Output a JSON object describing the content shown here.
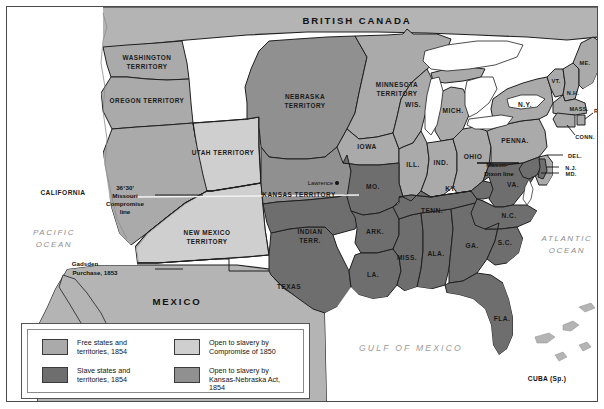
{
  "map": {
    "title_country_north": "BRITISH CANADA",
    "title_country_south": "MEXICO",
    "oceans": [
      {
        "name": "PACIFIC OCEAN",
        "line1": "PACIFIC",
        "line2": "OCEAN"
      },
      {
        "name": "ATLANTIC OCEAN",
        "line1": "ATLANTIC",
        "line2": "OCEAN"
      }
    ],
    "gulf_label": "GULF OF MEXICO",
    "cuba_label": "CUBA (Sp.)",
    "city": {
      "name": "Lawrence"
    },
    "annotations": [
      {
        "id": "missouri-compromise",
        "line1": "36°30'",
        "line2": "Missouri",
        "line3": "Compromise",
        "line4": "line"
      },
      {
        "id": "gadsden",
        "line1": "Gadsden",
        "line2": "Purchase, 1853"
      },
      {
        "id": "mason-dixon",
        "line1": "Mason-",
        "line2": "Dixon line"
      }
    ],
    "territories": [
      {
        "id": "washington",
        "line1": "WASHINGTON",
        "line2": "TERRITORY"
      },
      {
        "id": "oregon",
        "line1": "OREGON TERRITORY",
        "line2": ""
      },
      {
        "id": "utah",
        "line1": "UTAH TERRITORY",
        "line2": ""
      },
      {
        "id": "new-mexico",
        "line1": "NEW MEXICO",
        "line2": "TERRITORY"
      },
      {
        "id": "nebraska",
        "line1": "NEBRASKA",
        "line2": "TERRITORY"
      },
      {
        "id": "kansas",
        "line1": "KANSAS TERRITORY",
        "line2": ""
      },
      {
        "id": "minnesota",
        "line1": "MINNESOTA",
        "line2": "TERRITORY"
      },
      {
        "id": "indian",
        "line1": "INDIAN",
        "line2": "TERR."
      }
    ],
    "states": [
      {
        "id": "california",
        "label": "CALIFORNIA"
      },
      {
        "id": "texas",
        "label": "TEXAS"
      },
      {
        "id": "iowa",
        "label": "IOWA"
      },
      {
        "id": "wisconsin",
        "label": "WIS."
      },
      {
        "id": "michigan",
        "label": "MICH."
      },
      {
        "id": "illinois",
        "label": "ILL."
      },
      {
        "id": "indiana",
        "label": "IND."
      },
      {
        "id": "ohio",
        "label": "OHIO"
      },
      {
        "id": "missouri",
        "label": "MO."
      },
      {
        "id": "arkansas",
        "label": "ARK."
      },
      {
        "id": "louisiana",
        "label": "LA."
      },
      {
        "id": "mississippi",
        "label": "MISS."
      },
      {
        "id": "alabama",
        "label": "ALA."
      },
      {
        "id": "georgia",
        "label": "GA."
      },
      {
        "id": "florida",
        "label": "FLA."
      },
      {
        "id": "tennessee",
        "label": "TENN."
      },
      {
        "id": "kentucky",
        "label": "KY."
      },
      {
        "id": "virginia",
        "label": "VA."
      },
      {
        "id": "north-carolina",
        "label": "N.C."
      },
      {
        "id": "south-carolina",
        "label": "S.C."
      },
      {
        "id": "pennsylvania",
        "label": "PENNA."
      },
      {
        "id": "new-york",
        "label": "N.Y."
      },
      {
        "id": "maine",
        "label": "ME."
      },
      {
        "id": "vermont",
        "label": "VT."
      },
      {
        "id": "new-hampshire",
        "label": "N.H."
      },
      {
        "id": "massachusetts",
        "label": "MASS."
      },
      {
        "id": "rhode-island",
        "label": "R.I."
      },
      {
        "id": "connecticut",
        "label": "CONN."
      },
      {
        "id": "new-jersey",
        "label": "N.J."
      },
      {
        "id": "delaware",
        "label": "DEL."
      },
      {
        "id": "maryland",
        "label": "MD."
      }
    ]
  },
  "legend": {
    "items": [
      {
        "id": "free-states",
        "color": "#aaaaaa",
        "line1": "Free states and",
        "line2": "territories, 1854",
        "line3": ""
      },
      {
        "id": "slave-states",
        "color": "#6e6e6e",
        "line1": "Slave states and",
        "line2": "territories, 1854",
        "line3": ""
      },
      {
        "id": "open-compromise-1850",
        "color": "#cfcfcf",
        "line1": "Open to slavery by",
        "line2": "Compromise of 1850",
        "line3": ""
      },
      {
        "id": "open-kansas-nebraska",
        "color": "#909090",
        "line1": "Open to slavery by",
        "line2": "Kansas-Nebraska Act,",
        "line3": "1854"
      }
    ]
  },
  "colors": {
    "free": "#aaaaaa",
    "slave": "#6e6e6e",
    "open1850": "#cfcfcf",
    "openKN": "#909090",
    "water": "#ffffff",
    "foreign": "#b4b4b4",
    "border": "#1f1f1f"
  }
}
